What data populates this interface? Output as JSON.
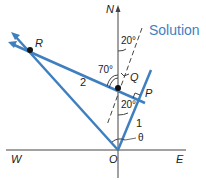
{
  "title": "Solution",
  "colors": {
    "vector": "#3f7fc0",
    "axis": "#444444",
    "text": "#222222"
  },
  "points": {
    "N": "N",
    "W": "W",
    "E": "E",
    "O": "O",
    "R": "R",
    "Q": "Q",
    "P": "P"
  },
  "vector_labels": {
    "v1": "1",
    "v2": "2"
  },
  "angles": {
    "a_top": "20°",
    "a_mid": "20°",
    "a_left": "70°",
    "theta": "θ"
  }
}
